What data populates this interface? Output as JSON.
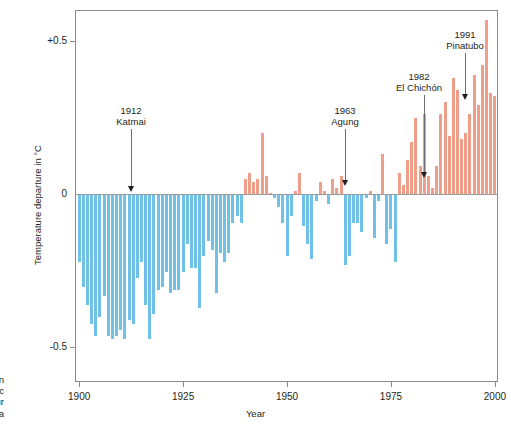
{
  "figure": {
    "caption_fragment_lines": [
      "ten",
      "nic",
      "fur",
      "a"
    ]
  },
  "chart_data": {
    "type": "bar",
    "title": "",
    "xlabel": "Year",
    "ylabel": "Temperature departure in °C",
    "xlim": [
      1899,
      2000.5
    ],
    "ylim": [
      -0.62,
      0.62
    ],
    "grid": false,
    "legend": null,
    "xticks": [
      1900,
      1925,
      1950,
      1975,
      2000
    ],
    "xticklabels": [
      "1900",
      "1925",
      "1950",
      "1975",
      "2000"
    ],
    "yticks": [
      0.5,
      0,
      -0.5
    ],
    "yticklabels": [
      "+0.5",
      "0",
      "-0.5"
    ],
    "colors": {
      "positive": "#ef9e89",
      "negative": "#6fc1e8",
      "axis": "#8b8b8b"
    },
    "annotations": [
      {
        "year": 1912,
        "event": "Katmai",
        "line1": "1912",
        "line2": "Katmai",
        "label_x": 131,
        "label_y": 105,
        "stem_x": 131,
        "stem_top": 129,
        "stem_bottom": 186
      },
      {
        "year": 1963,
        "event": "Agung",
        "line1": "1963",
        "line2": "Agung",
        "label_x": 345,
        "label_y": 105,
        "stem_x": 345,
        "stem_top": 129,
        "stem_bottom": 180
      },
      {
        "year": 1982,
        "event": "El Chichón",
        "line1": "1982",
        "line2": "El Chichón",
        "label_x": 419,
        "label_y": 71,
        "stem_x": 424,
        "stem_top": 95,
        "stem_bottom": 172
      },
      {
        "year": 1991,
        "event": "Pinatubo",
        "line1": "1991",
        "line2": "Pinatubo",
        "label_x": 465,
        "label_y": 29,
        "stem_x": 465,
        "stem_top": 53,
        "stem_bottom": 94
      }
    ],
    "x": [
      1900,
      1901,
      1902,
      1903,
      1904,
      1905,
      1906,
      1907,
      1908,
      1909,
      1910,
      1911,
      1912,
      1913,
      1914,
      1915,
      1916,
      1917,
      1918,
      1919,
      1920,
      1921,
      1922,
      1923,
      1924,
      1925,
      1926,
      1927,
      1928,
      1929,
      1930,
      1931,
      1932,
      1933,
      1934,
      1935,
      1936,
      1937,
      1938,
      1939,
      1940,
      1941,
      1942,
      1943,
      1944,
      1945,
      1946,
      1947,
      1948,
      1949,
      1950,
      1951,
      1952,
      1953,
      1954,
      1955,
      1956,
      1957,
      1958,
      1959,
      1960,
      1961,
      1962,
      1963,
      1964,
      1965,
      1966,
      1967,
      1968,
      1969,
      1970,
      1971,
      1972,
      1973,
      1974,
      1975,
      1976,
      1977,
      1978,
      1979,
      1980,
      1981,
      1982,
      1983,
      1984,
      1985,
      1986,
      1987,
      1988,
      1989,
      1990,
      1991,
      1992,
      1993,
      1994,
      1995,
      1996,
      1997,
      1998,
      1999,
      2000
    ],
    "values": [
      -0.22,
      -0.3,
      -0.36,
      -0.42,
      -0.46,
      -0.4,
      -0.33,
      -0.46,
      -0.47,
      -0.46,
      -0.44,
      -0.47,
      -0.41,
      -0.42,
      -0.27,
      -0.22,
      -0.36,
      -0.47,
      -0.39,
      -0.31,
      -0.3,
      -0.25,
      -0.32,
      -0.31,
      -0.31,
      -0.25,
      -0.16,
      -0.24,
      -0.24,
      -0.37,
      -0.2,
      -0.15,
      -0.18,
      -0.32,
      -0.19,
      -0.22,
      -0.19,
      -0.09,
      -0.07,
      -0.09,
      0.05,
      0.07,
      0.04,
      0.05,
      0.2,
      0.06,
      0.0,
      -0.01,
      -0.04,
      -0.09,
      -0.2,
      -0.07,
      0.01,
      0.07,
      -0.1,
      -0.16,
      -0.21,
      -0.02,
      0.04,
      0.01,
      -0.03,
      0.05,
      0.02,
      0.06,
      -0.23,
      -0.2,
      -0.09,
      -0.09,
      -0.12,
      -0.01,
      0.01,
      -0.14,
      -0.02,
      0.13,
      -0.16,
      -0.11,
      -0.22,
      0.07,
      0.03,
      0.11,
      0.17,
      0.25,
      0.09,
      0.26,
      0.06,
      0.02,
      0.09,
      0.26,
      0.3,
      0.19,
      0.38,
      0.34,
      0.18,
      0.2,
      0.26,
      0.39,
      0.29,
      0.42,
      0.57,
      0.33,
      0.32
    ]
  }
}
